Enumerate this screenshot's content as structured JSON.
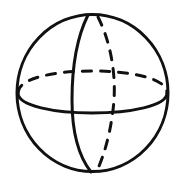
{
  "figure": {
    "background": "#ffffff",
    "stroke_color": "#111111",
    "stroke_width": 3,
    "outer_circle": {
      "cx": 92.5,
      "cy": 93,
      "rx": 76,
      "ry": 79
    },
    "equator_front": {
      "style": "solid"
    },
    "equator_back": {
      "style": "dashed"
    },
    "meridian_front": {
      "style": "solid"
    },
    "meridian_back": {
      "style": "dashed"
    }
  }
}
